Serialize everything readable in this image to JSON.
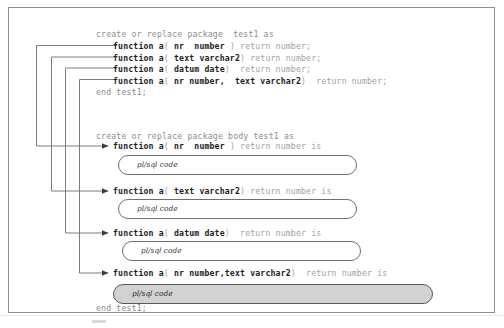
{
  "figure": {
    "frame_color": "#8e8e8e",
    "dim_text_color": "#9a9a9a",
    "bold_text_color": "#1e1e1e",
    "shaded_box_color": "#d2d2d2"
  },
  "spec": {
    "header": "create or replace package  test1 as",
    "footer": "end test1;",
    "declarations": [
      {
        "prefix": "function a",
        "open_paren": "(",
        "params": "nr  number",
        "close_paren": ")",
        "suffix": "return number;"
      },
      {
        "prefix": "function a",
        "open_paren": "(",
        "params": "text varchar2",
        "close_paren": ")",
        "suffix": "return number;"
      },
      {
        "prefix": "function a",
        "open_paren": "(",
        "params": "datum date",
        "close_paren": ")",
        "suffix": " return number;"
      },
      {
        "prefix": "function a",
        "open_paren": "(",
        "params": "nr number,  text varchar2",
        "close_paren": ")",
        "suffix": " return number;"
      }
    ]
  },
  "body": {
    "header": "create or replace package body test1 as",
    "footer": "end test1;",
    "implementations": [
      {
        "prefix": "function a",
        "open_paren": "(",
        "params": "nr  number",
        "close_paren": ")",
        "suffix": "return number is",
        "code_label": "pl/sql code",
        "shaded": false
      },
      {
        "prefix": "function a",
        "open_paren": "(",
        "params": "text varchar2",
        "close_paren": ")",
        "suffix": "return number is",
        "code_label": "pl/sql code",
        "shaded": false
      },
      {
        "prefix": "function a",
        "open_paren": "(",
        "params": "datum date",
        "close_paren": ")",
        "suffix": " return number is",
        "code_label": "pl/sql code",
        "shaded": false
      },
      {
        "prefix": "function a",
        "open_paren": "(",
        "params": "nr number,text varchar2",
        "close_paren": ")",
        "suffix": " return number is",
        "code_label": "pl/sql code",
        "shaded": true
      }
    ]
  },
  "connectors": {
    "count": 4,
    "description": "nested right-angle lines linking each spec declaration to its matching body implementation, each ending in a solid arrowhead"
  }
}
